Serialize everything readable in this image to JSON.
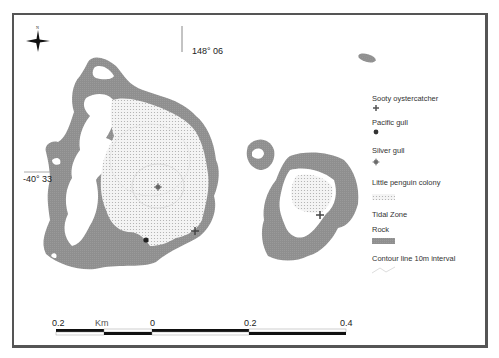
{
  "map": {
    "north_label": "N",
    "longitude_label": "148° 06",
    "latitude_label": "-40° 33"
  },
  "legend": {
    "items": [
      {
        "label": "Sooty oystercatcher",
        "symbol": "cross-icon"
      },
      {
        "label": "Pacific gull",
        "symbol": "dark-dot-icon"
      },
      {
        "label": "Silver gull",
        "symbol": "crosshair-dot-icon"
      },
      {
        "label": "Little penguin colony",
        "symbol": "dotted-fill"
      },
      {
        "label": "Tidal Zone",
        "symbol": "none"
      },
      {
        "label": "Rock",
        "symbol": "gray-fill"
      },
      {
        "label": "Contour line 10m interval",
        "symbol": "contour-line"
      }
    ]
  },
  "scale_bar": {
    "unit": "Km",
    "ticks": [
      "0.2",
      "0",
      "0.2",
      "0.4"
    ]
  },
  "colors": {
    "rock": "#8f8f8f",
    "penguin_fill": "#eeeeee",
    "frame": "#555555"
  }
}
